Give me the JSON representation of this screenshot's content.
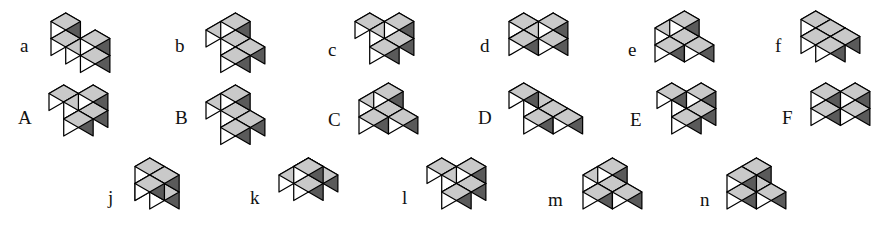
{
  "page": {
    "background_color": "#ffffff",
    "width": 894,
    "height": 233
  },
  "style": {
    "top_face_color": "#c9c9c9",
    "left_face_color": "#ffffff",
    "right_face_color": "#5a5a5a",
    "edge_color": "#000000",
    "label_color": "#111111",
    "cube_size": 17
  },
  "rows": [
    {
      "name": "row-lowercase-af",
      "items": [
        {
          "label": "a",
          "label_x": 20,
          "label_y": 36,
          "origin_x": 48,
          "origin_y": 10,
          "cubes": [
            [
              0,
              0,
              1
            ],
            [
              0,
              0,
              0
            ],
            [
              1,
              0,
              0
            ],
            [
              2,
              0,
              0
            ],
            [
              2,
              0,
              1
            ]
          ]
        },
        {
          "label": "b",
          "label_x": 175,
          "label_y": 36,
          "origin_x": 203,
          "origin_y": 10,
          "cubes": [
            [
              0,
              0,
              0
            ],
            [
              1,
              0,
              0
            ],
            [
              1,
              0,
              1
            ],
            [
              2,
              0,
              0
            ],
            [
              2,
              1,
              0
            ]
          ]
        },
        {
          "label": "c",
          "label_x": 328,
          "label_y": 40,
          "origin_x": 352,
          "origin_y": 10,
          "cubes": [
            [
              0,
              0,
              0
            ],
            [
              1,
              0,
              0
            ],
            [
              2,
              0,
              0
            ],
            [
              2,
              0,
              1
            ],
            [
              2,
              1,
              0
            ]
          ]
        },
        {
          "label": "d",
          "label_x": 480,
          "label_y": 36,
          "origin_x": 506,
          "origin_y": 10,
          "cubes": [
            [
              0,
              0,
              0
            ],
            [
              1,
              0,
              0
            ],
            [
              2,
              0,
              0
            ],
            [
              2,
              0,
              1
            ],
            [
              1,
              1,
              0
            ]
          ]
        },
        {
          "label": "e",
          "label_x": 628,
          "label_y": 40,
          "origin_x": 652,
          "origin_y": 8,
          "cubes": [
            [
              0,
              0,
              0
            ],
            [
              1,
              0,
              0
            ],
            [
              1,
              1,
              0
            ],
            [
              1,
              0,
              1
            ],
            [
              2,
              0,
              0
            ]
          ]
        },
        {
          "label": "f",
          "label_x": 775,
          "label_y": 36,
          "origin_x": 798,
          "origin_y": 8,
          "cubes": [
            [
              0,
              0,
              0
            ],
            [
              1,
              0,
              0
            ],
            [
              1,
              1,
              0
            ],
            [
              2,
              1,
              0
            ],
            [
              2,
              0,
              0
            ]
          ]
        }
      ]
    },
    {
      "name": "row-uppercase-AF",
      "items": [
        {
          "label": "A",
          "label_x": 18,
          "label_y": 108,
          "origin_x": 46,
          "origin_y": 82,
          "cubes": [
            [
              0,
              0,
              0
            ],
            [
              1,
              0,
              0
            ],
            [
              2,
              0,
              0
            ],
            [
              2,
              0,
              1
            ],
            [
              2,
              1,
              0
            ]
          ]
        },
        {
          "label": "B",
          "label_x": 175,
          "label_y": 108,
          "origin_x": 203,
          "origin_y": 82,
          "cubes": [
            [
              0,
              0,
              0
            ],
            [
              1,
              0,
              0
            ],
            [
              1,
              0,
              1
            ],
            [
              2,
              0,
              0
            ],
            [
              2,
              1,
              0
            ]
          ]
        },
        {
          "label": "C",
          "label_x": 328,
          "label_y": 110,
          "origin_x": 356,
          "origin_y": 80,
          "cubes": [
            [
              0,
              0,
              0
            ],
            [
              1,
              0,
              0
            ],
            [
              2,
              0,
              0
            ],
            [
              1,
              0,
              1
            ],
            [
              1,
              1,
              0
            ]
          ]
        },
        {
          "label": "D",
          "label_x": 478,
          "label_y": 108,
          "origin_x": 506,
          "origin_y": 80,
          "cubes": [
            [
              0,
              0,
              0
            ],
            [
              0,
              1,
              1
            ],
            [
              1,
              0,
              0
            ],
            [
              1,
              1,
              0
            ],
            [
              2,
              0,
              0
            ]
          ]
        },
        {
          "label": "E",
          "label_x": 630,
          "label_y": 110,
          "origin_x": 654,
          "origin_y": 80,
          "cubes": [
            [
              0,
              0,
              0
            ],
            [
              1,
              0,
              0
            ],
            [
              1,
              1,
              0
            ],
            [
              1,
              0,
              1
            ],
            [
              0,
              1,
              1
            ]
          ]
        },
        {
          "label": "F",
          "label_x": 782,
          "label_y": 108,
          "origin_x": 808,
          "origin_y": 80,
          "cubes": [
            [
              0,
              0,
              0
            ],
            [
              0,
              1,
              0
            ],
            [
              1,
              0,
              0
            ],
            [
              1,
              0,
              1
            ],
            [
              0,
              1,
              1
            ]
          ]
        }
      ]
    },
    {
      "name": "row-lowercase-jn",
      "items": [
        {
          "label": "j",
          "label_x": 108,
          "label_y": 188,
          "origin_x": 132,
          "origin_y": 155,
          "cubes": [
            [
              0,
              0,
              0
            ],
            [
              0,
              0,
              1
            ],
            [
              1,
              0,
              0
            ],
            [
              1,
              0,
              1
            ],
            [
              1,
              1,
              1
            ]
          ]
        },
        {
          "label": "k",
          "label_x": 250,
          "label_y": 188,
          "origin_x": 276,
          "origin_y": 155,
          "cubes": [
            [
              0,
              0,
              0
            ],
            [
              1,
              0,
              0
            ],
            [
              1,
              1,
              0
            ],
            [
              1,
              1,
              1
            ],
            [
              0,
              1,
              0
            ]
          ]
        },
        {
          "label": "l",
          "label_x": 402,
          "label_y": 188,
          "origin_x": 424,
          "origin_y": 155,
          "cubes": [
            [
              0,
              0,
              0
            ],
            [
              1,
              0,
              0
            ],
            [
              2,
              0,
              0
            ],
            [
              2,
              0,
              1
            ],
            [
              2,
              1,
              0
            ]
          ]
        },
        {
          "label": "m",
          "label_x": 548,
          "label_y": 190,
          "origin_x": 580,
          "origin_y": 155,
          "cubes": [
            [
              0,
              0,
              0
            ],
            [
              1,
              0,
              0
            ],
            [
              1,
              1,
              0
            ],
            [
              1,
              0,
              1
            ],
            [
              2,
              0,
              0
            ]
          ]
        },
        {
          "label": "n",
          "label_x": 700,
          "label_y": 190,
          "origin_x": 724,
          "origin_y": 155,
          "cubes": [
            [
              0,
              0,
              0
            ],
            [
              0,
              1,
              0
            ],
            [
              0,
              0,
              1
            ],
            [
              1,
              0,
              0
            ],
            [
              0,
              1,
              1
            ]
          ]
        }
      ]
    }
  ]
}
